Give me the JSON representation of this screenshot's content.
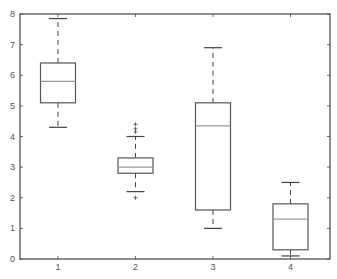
{
  "chart_data": {
    "type": "boxplot",
    "title": "",
    "xlabel": "",
    "ylabel": "",
    "categories": [
      "1",
      "2",
      "3",
      "4"
    ],
    "ylim": [
      0,
      8
    ],
    "yticks": [
      "0",
      "1",
      "2",
      "3",
      "4",
      "5",
      "6",
      "7",
      "8"
    ],
    "grid": false,
    "boxes": [
      {
        "label": "1",
        "whisker_low": 4.3,
        "q1": 5.1,
        "median": 5.8,
        "q3": 6.4,
        "whisker_high": 7.85,
        "outliers": []
      },
      {
        "label": "2",
        "whisker_low": 2.2,
        "q1": 2.8,
        "median": 3.0,
        "q3": 3.3,
        "whisker_high": 4.0,
        "outliers": [
          2.0,
          4.15,
          4.25,
          4.4
        ]
      },
      {
        "label": "3",
        "whisker_low": 1.0,
        "q1": 1.6,
        "median": 4.35,
        "q3": 5.1,
        "whisker_high": 6.9,
        "outliers": []
      },
      {
        "label": "4",
        "whisker_low": 0.1,
        "q1": 0.3,
        "median": 1.3,
        "q3": 1.8,
        "whisker_high": 2.5,
        "outliers": []
      }
    ],
    "colors": {
      "axis": "#444444",
      "box": "#555555",
      "median": "#999999",
      "whisker": "#444444",
      "outlier": "#555555"
    }
  }
}
